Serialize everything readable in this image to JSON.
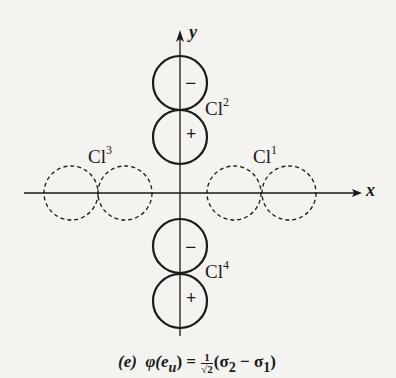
{
  "figure": {
    "axes": {
      "x_label": "x",
      "y_label": "y"
    },
    "ligands": [
      {
        "name": "Cl",
        "index": "1",
        "style": "dashed"
      },
      {
        "name": "Cl",
        "index": "2",
        "style": "solid"
      },
      {
        "name": "Cl",
        "index": "3",
        "style": "dashed"
      },
      {
        "name": "Cl",
        "index": "4",
        "style": "solid"
      }
    ],
    "lobe_signs": {
      "cl2_upper": "−",
      "cl2_lower": "+",
      "cl4_upper": "−",
      "cl4_lower": "+"
    },
    "caption": {
      "panel": "(e)",
      "lhs": "φ(e",
      "lhs_sub": "u",
      "lhs_close": ") =",
      "frac_num": "1",
      "frac_den": "√2",
      "rhs": "(σ",
      "rhs_sub1": "2",
      "rhs_mid": " − σ",
      "rhs_sub2": "1",
      "rhs_close": ")"
    }
  }
}
